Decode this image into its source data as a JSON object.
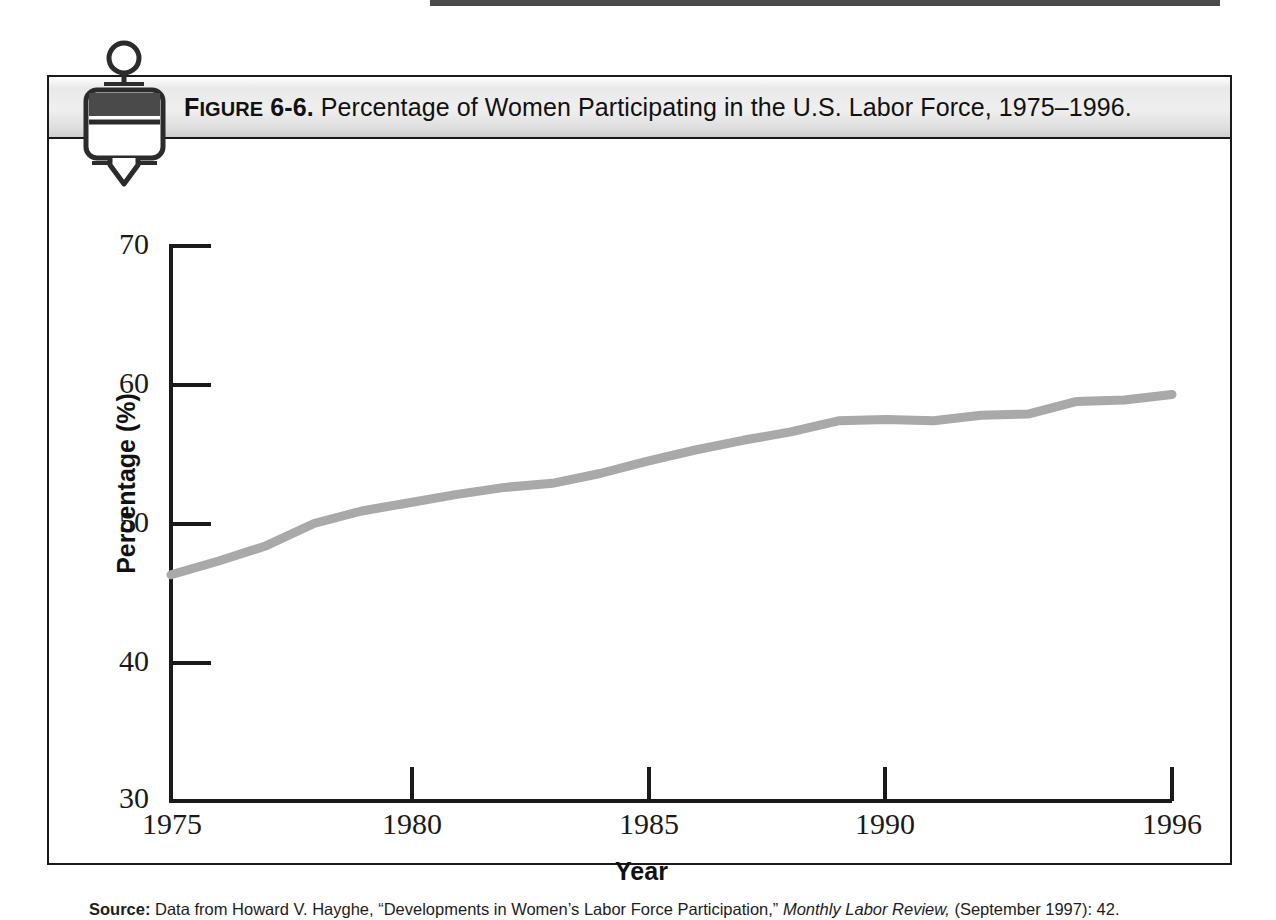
{
  "figure": {
    "label_prefix": "F",
    "label_smallcaps": "IGURE",
    "number": " 6-6.",
    "title_rest": " Percentage of Women Participating in the U.S. Labor Force, 1975–1996.",
    "icon": "clamp-pin-icon"
  },
  "source": {
    "label": "Source:",
    "text_before": " Data from Howard V. Hayghe, “Developments in Women’s Labor Force Participation,” ",
    "italic": "Monthly Labor Review,",
    "text_after": " (September 1997): 42."
  },
  "colors": {
    "line": "#a9a9a9",
    "axis": "#1a1a1a",
    "title_bar_top": "#efefef",
    "title_bar_bottom": "#cfcfcf",
    "text": "#111111"
  },
  "chart_data": {
    "type": "line",
    "title": "Percentage of Women Participating in the U.S. Labor Force, 1975–1996",
    "xlabel": "Year",
    "ylabel": "Percentage (%)",
    "xlim": [
      1975,
      1996
    ],
    "ylim": [
      30,
      70
    ],
    "grid": false,
    "legend": "none",
    "x_tick_labels": [
      "1975",
      "1980",
      "1985",
      "1990",
      "1996"
    ],
    "x_ticks": [
      1975,
      1980,
      1985,
      1990,
      1996
    ],
    "y_tick_labels": [
      "70",
      "60",
      "50",
      "40",
      "30"
    ],
    "y_ticks": [
      70,
      60,
      50,
      40,
      30
    ],
    "series": [
      {
        "name": "Percentage of women in the U.S. labor force",
        "color": "#a9a9a9",
        "x": [
          1975,
          1976,
          1977,
          1978,
          1979,
          1980,
          1981,
          1982,
          1983,
          1984,
          1985,
          1986,
          1987,
          1988,
          1989,
          1990,
          1991,
          1992,
          1993,
          1994,
          1995,
          1996
        ],
        "values": [
          46.3,
          47.3,
          48.4,
          50.0,
          50.9,
          51.5,
          52.1,
          52.6,
          52.9,
          53.6,
          54.5,
          55.3,
          56.0,
          56.6,
          57.4,
          57.5,
          57.4,
          57.8,
          57.9,
          58.8,
          58.9,
          59.3
        ]
      }
    ]
  }
}
